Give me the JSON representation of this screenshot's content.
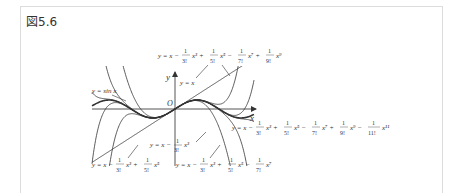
{
  "figure": {
    "label": "図5.6",
    "axes": {
      "x_label": "x",
      "y_label": "y",
      "origin_label": "O"
    },
    "curves": [
      {
        "name": "sin",
        "label": "y = sin x"
      },
      {
        "name": "T1",
        "label": "y = x"
      },
      {
        "name": "T3",
        "label": "y = x − (1/3!) x³"
      },
      {
        "name": "T5",
        "label": "y = x − (1/3!) x³ + (1/5!) x⁵"
      },
      {
        "name": "T7",
        "label": "y = x − (1/3!) x³ + (1/5!) x⁵ − (1/7!) x⁷"
      },
      {
        "name": "T9",
        "label": "y = x − (1/3!) x³ + (1/5!) x⁵ − (1/7!) x⁷ + (1/9!) x⁹"
      },
      {
        "name": "T11",
        "label": "y = x − (1/3!) x³ + (1/5!) x⁵ − (1/7!) x⁷ + (1/9!) x⁹ − (1/11!) x¹¹"
      }
    ]
  }
}
